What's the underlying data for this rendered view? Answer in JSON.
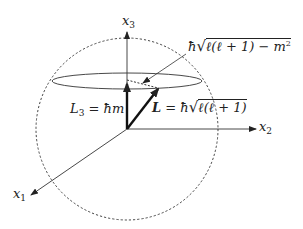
{
  "diagram": {
    "type": "angular-momentum-vector-model",
    "axes": {
      "x1": {
        "label": "x",
        "subscript": "1"
      },
      "x2": {
        "label": "x",
        "subscript": "2"
      },
      "x3": {
        "label": "x",
        "subscript": "3"
      }
    },
    "labels": {
      "L3": {
        "lhs": "L",
        "lhs_sub": "3",
        "eq": " = ",
        "rhs": "ħm"
      },
      "L": {
        "lhs": "L",
        "eq": " = ",
        "hbar": "ħ",
        "radicand": "ℓ(ℓ + 1)"
      },
      "perp": {
        "hbar": "ħ",
        "radicand": "ℓ(ℓ + 1) − m",
        "exp": "2"
      }
    },
    "elements": {
      "sphere": "dashed circle",
      "cone_circle": "ellipse",
      "L3_vector": "thick arrow along x3",
      "L_vector": "thick arrow on cone",
      "perp_component": "dashed line",
      "pointer": "thin arrow"
    },
    "colors": {
      "stroke": "#222222",
      "background": "#ffffff"
    }
  }
}
